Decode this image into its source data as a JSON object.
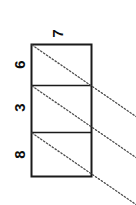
{
  "figure": {
    "kind": "stacked-rectangles-with-diagonals",
    "orientation": "vertical-stack",
    "rotation_of_labels_deg": -90,
    "background_color": "#ffffff",
    "stroke_color": "#1a1a1a",
    "diagonal_color": "#4d4d4d",
    "diagonal_style": "dotted"
  },
  "top_label": {
    "text": "7",
    "name": "top-label-7"
  },
  "cells": [
    {
      "label": "6",
      "name": "cell-6"
    },
    {
      "label": "3",
      "name": "cell-3"
    },
    {
      "label": "8",
      "name": "cell-8"
    }
  ],
  "geometry": {
    "box_left": 31,
    "box_right": 92,
    "box_top": 44,
    "box_bottom": 177,
    "divider_1_y": 85,
    "divider_2_y": 132,
    "diagonal_extend_to_x": 135,
    "label_x": 19,
    "top_label_x": 57,
    "top_label_y": 33,
    "cell_label_ys": [
      65,
      108,
      155
    ]
  }
}
